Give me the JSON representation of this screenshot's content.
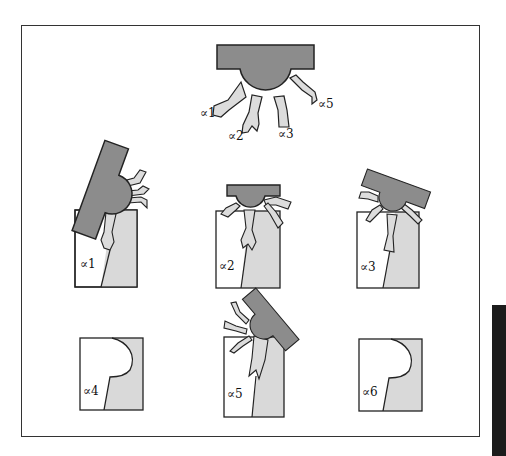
{
  "figure": {
    "title": "",
    "colors": {
      "body_fill": "#8c8c8c",
      "arm_fill": "#dcdcdc",
      "outline": "#222222",
      "panel_left_fill": "#ffffff",
      "panel_right_fill": "#d9d9d9",
      "frame": "#333333",
      "edge_bar": "#1c1c1c"
    },
    "reference": {
      "arm_labels": [
        "∝1",
        "∝2",
        "∝3",
        "∝5"
      ]
    },
    "panels": [
      {
        "id": "a1",
        "label": "∝1",
        "has_molecule": true
      },
      {
        "id": "a2",
        "label": "∝2",
        "has_molecule": true
      },
      {
        "id": "a3",
        "label": "∝3",
        "has_molecule": true
      },
      {
        "id": "a4",
        "label": "∝4",
        "has_molecule": false
      },
      {
        "id": "a5",
        "label": "∝5",
        "has_molecule": true
      },
      {
        "id": "a6",
        "label": "∝6",
        "has_molecule": false
      }
    ]
  }
}
